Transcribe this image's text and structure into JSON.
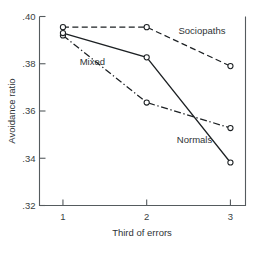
{
  "chart_data": {
    "type": "line",
    "title": "",
    "xlabel": "Third of errors",
    "ylabel": "Avoidance ratio",
    "x": [
      1,
      2,
      3
    ],
    "categories": [
      "1",
      "2",
      "3"
    ],
    "xtick_labels": [
      "1",
      "2",
      "3"
    ],
    "ytick_labels": [
      ".32",
      ".34",
      ".36",
      ".38",
      ".40"
    ],
    "ytick_values": [
      0.32,
      0.34,
      0.36,
      0.38,
      0.4
    ],
    "xlim": [
      0.72,
      3.18
    ],
    "ylim": [
      0.32,
      0.4
    ],
    "grid": false,
    "legend": "inline-labels",
    "marker": "open-circle",
    "series": [
      {
        "name": "Sociopaths",
        "label": "Sociopaths",
        "line_style": "dashed",
        "values": [
          0.3955,
          0.3955,
          0.379
        ],
        "label_x": 2.38,
        "label_y": 0.3925,
        "label_anchor": "start"
      },
      {
        "name": "Mixed",
        "label": "Mixed",
        "line_style": "dashdot",
        "values": [
          0.392,
          0.3636,
          0.3528
        ],
        "label_x": 1.2,
        "label_y": 0.3795,
        "label_anchor": "start"
      },
      {
        "name": "Normals",
        "label": "Normals",
        "line_style": "solid",
        "values": [
          0.393,
          0.3827,
          0.3382
        ],
        "label_x": 2.36,
        "label_y": 0.3465,
        "label_anchor": "start"
      }
    ]
  },
  "axes": {
    "x_title": "Third of errors",
    "y_title": "Avoidance ratio"
  }
}
